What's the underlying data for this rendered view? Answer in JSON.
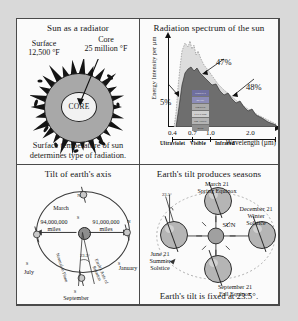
{
  "page": {
    "background": "#d9d9d9",
    "sheet_background": "#fbfbfb",
    "border_color": "#4a4a4a"
  },
  "panels": {
    "sun_radiator": {
      "title": "Sun as a radiator",
      "surface_label": "Surface",
      "surface_value": "12,500 °F",
      "core_label": "Core",
      "core_value": "25 million °F",
      "core_body_label": "CORE",
      "caption_line1": "Surface temperature of sun",
      "caption_line2": "determines type of radiation."
    },
    "spectrum": {
      "title": "Radiation spectrum of the sun",
      "ylabel": "Energy Intensity per µm",
      "xlabel": "Wavelength (µm)",
      "ticks": [
        "0.4",
        "0.7",
        "1.0",
        "2.0"
      ],
      "regions": [
        "Ultraviolet",
        "Visible",
        "Infrared"
      ],
      "pct_uv": "5%",
      "pct_vis": "47%",
      "pct_ir": "48%",
      "color_bands": [
        "VIOLET",
        "BLUE",
        "GREEN",
        "YELLOW",
        "ORANGE",
        "RED"
      ]
    },
    "tilt_axis": {
      "title": "Tilt of earth's axis",
      "month_top": "March",
      "month_left": "July",
      "month_right": "January",
      "month_bottom": "September",
      "dist_left": "94,000,000",
      "dist_left_unit": "miles",
      "dist_right": "91,000,000",
      "dist_right_unit": "miles",
      "angle": "23.5°",
      "normal_label": "Normal to Plane",
      "axis_label": "Earth's Axis of Rotation",
      "pole_n": "N",
      "pole_s": "S"
    },
    "seasons": {
      "title": "Earth's tilt produces seasons",
      "sun_label": "SUN",
      "angle": "23.5°",
      "caption": "Earth's tilt is fixed at 23.5°.",
      "positions": [
        {
          "date": "March 21",
          "event": "Spring Equinox"
        },
        {
          "date": "December 21",
          "event_line1": "Winter",
          "event_line2": "Solstice"
        },
        {
          "date": "September 21",
          "event": "Fall Equinox"
        },
        {
          "date": "June 21",
          "event_line1": "Summer",
          "event_line2": "Solstice"
        }
      ]
    }
  },
  "chart_data": {
    "type": "area",
    "title": "Radiation spectrum of the sun",
    "xlabel": "Wavelength (µm)",
    "ylabel": "Energy Intensity per µm",
    "xticks": [
      0.4,
      0.7,
      1.0,
      2.0
    ],
    "xlim": [
      0.2,
      2.6
    ],
    "ylim": [
      0,
      100
    ],
    "grid": false,
    "legend": "none",
    "series": [
      {
        "name": "Extraterrestrial solar irradiance (outer dotted curve)",
        "x": [
          0.2,
          0.3,
          0.4,
          0.45,
          0.5,
          0.6,
          0.7,
          0.8,
          1.0,
          1.2,
          1.5,
          2.0,
          2.5
        ],
        "values": [
          4,
          30,
          88,
          100,
          96,
          84,
          74,
          62,
          45,
          32,
          20,
          9,
          4
        ]
      },
      {
        "name": "Solar radiation at sea level (shaded curve)",
        "x": [
          0.2,
          0.3,
          0.4,
          0.45,
          0.5,
          0.6,
          0.7,
          0.8,
          1.0,
          1.2,
          1.5,
          2.0,
          2.5
        ],
        "values": [
          0,
          8,
          62,
          72,
          78,
          70,
          62,
          50,
          34,
          24,
          12,
          5,
          2
        ]
      }
    ],
    "annotations": [
      {
        "text": "5%",
        "region": "Ultraviolet",
        "band": [
          0.2,
          0.4
        ]
      },
      {
        "text": "47%",
        "region": "Visible",
        "band": [
          0.4,
          0.7
        ]
      },
      {
        "text": "48%",
        "region": "Infrared",
        "band": [
          0.7,
          2.6
        ]
      }
    ],
    "color_bands": [
      "VIOLET",
      "BLUE",
      "GREEN",
      "YELLOW",
      "ORANGE",
      "RED"
    ]
  }
}
